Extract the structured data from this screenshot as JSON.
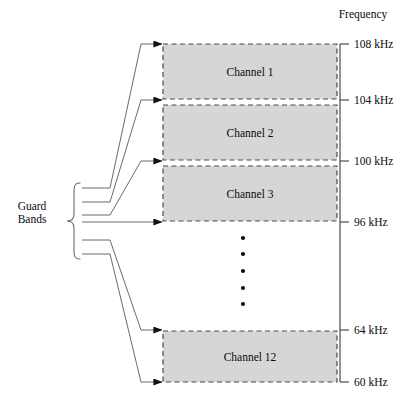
{
  "figure": {
    "axis_title": "Frequency",
    "guard_label_line1": "Guard",
    "guard_label_line2": "Bands",
    "ellipsis_dot_count": 5,
    "colors": {
      "channel_fill": "#d6d6d6",
      "channel_border": "#4a4a4a",
      "axis": "#4a4a4a",
      "leader_line": "#6b6b6b",
      "brace": "#6b6b6b",
      "text": "#0a0a0a",
      "background": "#ffffff"
    }
  },
  "channels": [
    {
      "label": "Channel 1",
      "top_khz": 108,
      "bottom_khz": 104,
      "x": 163,
      "y": 44,
      "w": 174,
      "h": 55
    },
    {
      "label": "Channel 2",
      "top_khz": 104,
      "bottom_khz": 100,
      "x": 163,
      "y": 105,
      "w": 174,
      "h": 55
    },
    {
      "label": "Channel 3",
      "top_khz": 100,
      "bottom_khz": 96,
      "x": 163,
      "y": 166,
      "w": 174,
      "h": 55
    },
    {
      "label": "Channel 12",
      "top_khz": 64,
      "bottom_khz": 60,
      "x": 163,
      "y": 331,
      "w": 174,
      "h": 51
    }
  ],
  "ticks": [
    {
      "label": "108 kHz",
      "y": 44
    },
    {
      "label": "104 kHz",
      "y": 100
    },
    {
      "label": "100 kHz",
      "y": 161
    },
    {
      "label": "96 kHz",
      "y": 222
    },
    {
      "label": "64 kHz",
      "y": 330
    },
    {
      "label": "60 kHz",
      "y": 382
    }
  ],
  "ellipsis_dots": [
    {
      "x": 243,
      "y": 238
    },
    {
      "x": 243,
      "y": 254
    },
    {
      "x": 243,
      "y": 271
    },
    {
      "x": 243,
      "y": 288
    },
    {
      "x": 243,
      "y": 304
    }
  ],
  "guard_band_arrows": [
    {
      "target_y": 44,
      "brace_y": 188
    },
    {
      "target_y": 100,
      "brace_y": 202
    },
    {
      "target_y": 161,
      "brace_y": 215
    },
    {
      "target_y": 222,
      "brace_y": 226
    },
    {
      "target_y": 330,
      "brace_y": 240
    },
    {
      "target_y": 382,
      "brace_y": 254
    }
  ]
}
